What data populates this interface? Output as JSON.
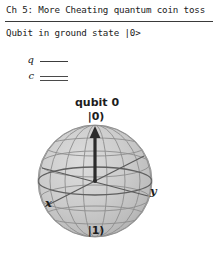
{
  "header": {
    "title": "Ch 5: More Cheating quantum coin toss",
    "status": "Qubit in ground state |0>"
  },
  "circuit": {
    "wires": [
      {
        "label": "q",
        "type": "quantum-wire"
      },
      {
        "label": "c",
        "type": "classical-wire"
      }
    ]
  },
  "bloch": {
    "title": "qubit 0",
    "ket_top": "|0)",
    "ket_bottom": "|1)",
    "axis_x": "x",
    "axis_y": "y",
    "state_vector": {
      "theta_deg": 0,
      "phi_deg": 0,
      "direction": "up",
      "points_to": "|0)"
    },
    "colors": {
      "sphere_fill": "#c9c9c9",
      "mesh": "#8a8a8a",
      "equator": "#5a5a5a",
      "arrow": "#2b2b2b",
      "text": "#1d1d1d"
    }
  }
}
